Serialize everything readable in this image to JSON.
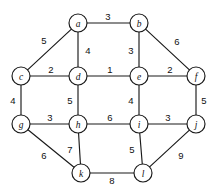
{
  "figure": {
    "title": "",
    "background_color": "#ffffff",
    "stroke_color": "#1a1a1a",
    "width": 211,
    "height": 190
  },
  "chart_data": {
    "type": "diagram",
    "diagram_kind": "undirected-weighted-graph",
    "title": "",
    "xlabel": "",
    "ylabel": "",
    "grid": false,
    "legend": null,
    "node_radius": 9,
    "nodes": [
      {
        "id": "a",
        "label": "a",
        "x": 78,
        "y": 23
      },
      {
        "id": "b",
        "label": "b",
        "x": 139,
        "y": 23
      },
      {
        "id": "c",
        "label": "c",
        "x": 21,
        "y": 76
      },
      {
        "id": "d",
        "label": "d",
        "x": 78,
        "y": 76
      },
      {
        "id": "e",
        "label": "e",
        "x": 139,
        "y": 76
      },
      {
        "id": "f",
        "label": "f",
        "x": 196,
        "y": 76
      },
      {
        "id": "g",
        "label": "g",
        "x": 21,
        "y": 124
      },
      {
        "id": "h",
        "label": "h",
        "x": 78,
        "y": 124
      },
      {
        "id": "i",
        "label": "i",
        "x": 139,
        "y": 124
      },
      {
        "id": "j",
        "label": "j",
        "x": 196,
        "y": 124
      },
      {
        "id": "k",
        "label": "k",
        "x": 81,
        "y": 173
      },
      {
        "id": "l",
        "label": "l",
        "x": 143,
        "y": 173
      }
    ],
    "edges": [
      {
        "source": "a",
        "target": "b",
        "weight": 3,
        "label": "3",
        "lx": 108,
        "ly": 16
      },
      {
        "source": "a",
        "target": "c",
        "weight": 5,
        "label": "5",
        "lx": 44,
        "ly": 40
      },
      {
        "source": "a",
        "target": "d",
        "weight": 4,
        "label": "4",
        "lx": 88,
        "ly": 50
      },
      {
        "source": "b",
        "target": "e",
        "weight": 3,
        "label": "3",
        "lx": 131,
        "ly": 50
      },
      {
        "source": "b",
        "target": "f",
        "weight": 6,
        "label": "6",
        "lx": 177,
        "ly": 41
      },
      {
        "source": "c",
        "target": "d",
        "weight": 2,
        "label": "2",
        "lx": 51,
        "ly": 69
      },
      {
        "source": "c",
        "target": "g",
        "weight": 4,
        "label": "4",
        "lx": 13,
        "ly": 100
      },
      {
        "source": "d",
        "target": "e",
        "weight": 1,
        "label": "1",
        "lx": 110,
        "ly": 69
      },
      {
        "source": "d",
        "target": "h",
        "weight": 5,
        "label": "5",
        "lx": 70,
        "ly": 100
      },
      {
        "source": "e",
        "target": "f",
        "weight": 2,
        "label": "2",
        "lx": 170,
        "ly": 69
      },
      {
        "source": "e",
        "target": "i",
        "weight": 4,
        "label": "4",
        "lx": 131,
        "ly": 100
      },
      {
        "source": "f",
        "target": "j",
        "weight": 5,
        "label": "5",
        "lx": 204,
        "ly": 100
      },
      {
        "source": "g",
        "target": "h",
        "weight": 3,
        "label": "3",
        "lx": 50,
        "ly": 117
      },
      {
        "source": "g",
        "target": "k",
        "weight": 6,
        "label": "6",
        "lx": 44,
        "ly": 155
      },
      {
        "source": "h",
        "target": "i",
        "weight": 6,
        "label": "6",
        "lx": 110,
        "ly": 117
      },
      {
        "source": "h",
        "target": "k",
        "weight": 7,
        "label": "7",
        "lx": 70,
        "ly": 149
      },
      {
        "source": "i",
        "target": "j",
        "weight": 3,
        "label": "3",
        "lx": 168,
        "ly": 117
      },
      {
        "source": "i",
        "target": "l",
        "weight": 5,
        "label": "5",
        "lx": 132,
        "ly": 149
      },
      {
        "source": "j",
        "target": "l",
        "weight": 9,
        "label": "9",
        "lx": 181,
        "ly": 155
      },
      {
        "source": "k",
        "target": "l",
        "weight": 8,
        "label": "8",
        "lx": 112,
        "ly": 180
      }
    ]
  }
}
